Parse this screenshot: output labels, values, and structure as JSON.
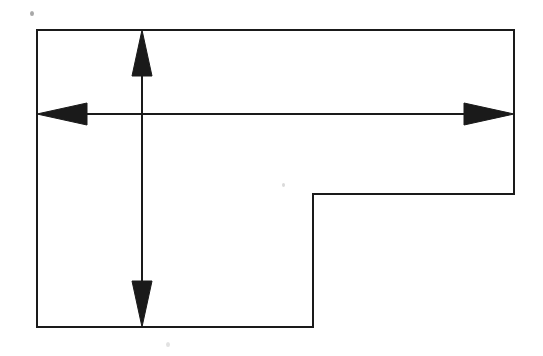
{
  "document": {
    "title": "L-Shaped Floor Plan Dimension Diagram",
    "background_color": "#ffffff",
    "width": 543,
    "height": 356
  },
  "figure": {
    "name": "l-shaped-outline-with-dimension-arrows",
    "line_color": "#1a1a1a",
    "stroke_width": 2,
    "fill": "none"
  },
  "shape": {
    "name": "l-shape-polygon",
    "type": "polygon",
    "vertices": [
      {
        "label": "top-left",
        "x": 37,
        "y": 30
      },
      {
        "label": "top-right",
        "x": 514,
        "y": 30
      },
      {
        "label": "right-step",
        "x": 514,
        "y": 194
      },
      {
        "label": "inner-corner",
        "x": 313,
        "y": 194
      },
      {
        "label": "lower-right",
        "x": 313,
        "y": 327
      },
      {
        "label": "bottom-left",
        "x": 37,
        "y": 327
      }
    ],
    "points_attr": "37,30 514,30 514,194 313,194 313,327 37,327"
  },
  "arrows": {
    "horizontal": {
      "name": "width-dimension-arrow",
      "orientation": "horizontal",
      "double_headed": true,
      "y": 114,
      "x_start": 37,
      "x_end": 514,
      "line_x1": 80,
      "line_x2": 472,
      "stroke_width": 2,
      "head_length": 50,
      "head_half_width": 11,
      "left_head_points": "37,114 87,103 87,125",
      "right_head_points": "514,114 464,103 464,125"
    },
    "vertical": {
      "name": "height-dimension-arrow",
      "orientation": "vertical",
      "double_headed": true,
      "x": 142,
      "y_start": 30,
      "y_end": 327,
      "line_y1": 36,
      "line_y2": 322,
      "stroke_width": 2,
      "head_length": 46,
      "head_half_width": 10,
      "top_head_points": "142,30 132,76 152,76",
      "bottom_head_points": "142,327 132,281 152,281"
    }
  },
  "artifacts": [
    {
      "name": "scan-speck-top-left",
      "x": 32,
      "y": 13,
      "color": "#a8a8a8"
    },
    {
      "name": "scan-speck-bottom",
      "x": 168,
      "y": 344,
      "color": "#e2e2e2"
    },
    {
      "name": "scan-speck-notch",
      "x": 283,
      "y": 185,
      "color": "#dadada"
    }
  ],
  "chart_data": {
    "type": "diagram",
    "title": "",
    "subtitle": "",
    "annotations": [],
    "labels": []
  }
}
